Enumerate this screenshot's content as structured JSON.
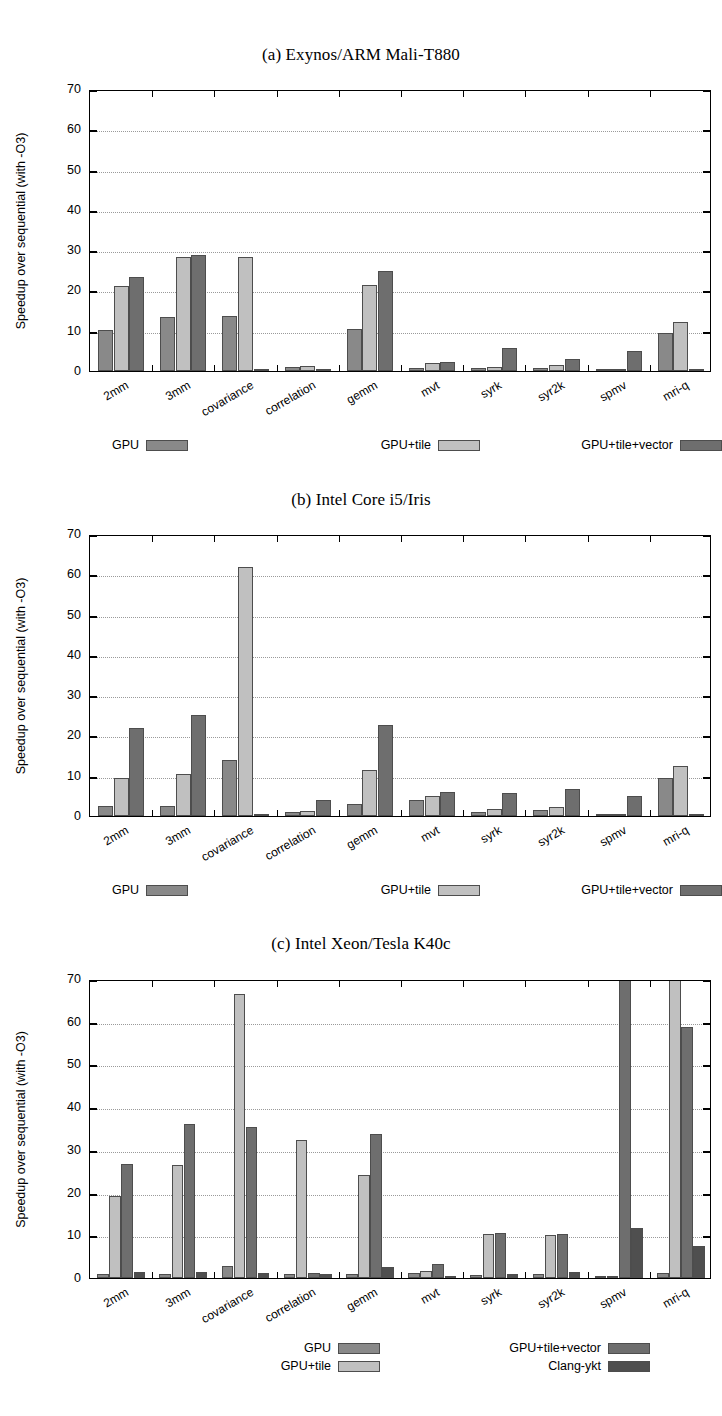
{
  "figure": {
    "ylabel": "Speedup over sequential (with -O3)",
    "yticks": [
      0,
      10,
      20,
      30,
      40,
      50,
      60,
      70
    ],
    "colors": {
      "gpu": "#898989",
      "gpu_tile": "#c0c0c0",
      "gpu_tile_vector": "#6e6e6e",
      "clang_ykt": "#4f4f4f",
      "grid": "#9a9a9a",
      "axis": "#000000"
    }
  },
  "charts": [
    {
      "id": "a",
      "title": "(a) Exynos/ARM Mali-T880",
      "chart_data": {
        "type": "bar",
        "title": "(a) Exynos/ARM Mali-T880",
        "xlabel": "",
        "ylabel": "Speedup over sequential (with -O3)",
        "ylim": [
          0,
          70
        ],
        "yticks": [
          0,
          10,
          20,
          30,
          40,
          50,
          60,
          70
        ],
        "grid": true,
        "legend_position": "below",
        "categories": [
          "2mm",
          "3mm",
          "covariance",
          "correlation",
          "gemm",
          "mvt",
          "syrk",
          "syr2k",
          "spmv",
          "mri-q"
        ],
        "series": [
          {
            "name": "GPU",
            "values": [
              10.2,
              13.3,
              13.7,
              1.0,
              10.5,
              0.7,
              0.8,
              0.7,
              0.3,
              9.4
            ]
          },
          {
            "name": "GPU+tile",
            "values": [
              21.2,
              28.2,
              28.4,
              1.2,
              21.3,
              1.9,
              1.0,
              1.6,
              0.3,
              12.2
            ]
          },
          {
            "name": "GPU+tile+vector",
            "values": [
              23.3,
              28.9,
              0.2,
              0.2,
              24.8,
              2.2,
              5.8,
              2.9,
              4.9,
              0.2
            ]
          }
        ]
      }
    },
    {
      "id": "b",
      "title": "(b) Intel Core i5/Iris",
      "chart_data": {
        "type": "bar",
        "title": "(b) Intel Core i5/Iris",
        "xlabel": "",
        "ylabel": "Speedup over sequential (with -O3)",
        "ylim": [
          0,
          70
        ],
        "yticks": [
          0,
          10,
          20,
          30,
          40,
          50,
          60,
          70
        ],
        "grid": true,
        "legend_position": "below",
        "categories": [
          "2mm",
          "3mm",
          "covariance",
          "correlation",
          "gemm",
          "mvt",
          "syrk",
          "syr2k",
          "spmv",
          "mri-q"
        ],
        "series": [
          {
            "name": "GPU",
            "values": [
              2.4,
              2.6,
              13.8,
              1.1,
              2.9,
              3.9,
              1.1,
              1.5,
              0.3,
              9.5
            ]
          },
          {
            "name": "GPU+tile",
            "values": [
              9.4,
              10.4,
              61.7,
              1.2,
              11.4,
              4.9,
              1.7,
              2.2,
              0.3,
              12.3
            ]
          },
          {
            "name": "GPU+tile+vector",
            "values": [
              21.9,
              25.1,
              0.2,
              3.9,
              22.5,
              5.9,
              5.8,
              6.6,
              5.0,
              0.2
            ]
          }
        ]
      }
    },
    {
      "id": "c",
      "title": "(c) Intel Xeon/Tesla K40c",
      "chart_data": {
        "type": "bar",
        "title": "(c) Intel Xeon/Tesla K40c",
        "xlabel": "",
        "ylabel": "Speedup over sequential (with -O3)",
        "ylim": [
          0,
          70
        ],
        "yticks": [
          0,
          10,
          20,
          30,
          40,
          50,
          60,
          70
        ],
        "grid": true,
        "legend_position": "below",
        "note": "bars exceeding 70 are clipped at the top axis",
        "categories": [
          "2mm",
          "3mm",
          "covariance",
          "correlation",
          "gemm",
          "mvt",
          "syrk",
          "syr2k",
          "spmv",
          "mri-q"
        ],
        "series": [
          {
            "name": "GPU",
            "values": [
              0.9,
              1.0,
              2.9,
              0.9,
              1.0,
              1.1,
              0.8,
              0.9,
              0.4,
              1.1
            ]
          },
          {
            "name": "GPU+tile",
            "values": [
              19.3,
              26.4,
              66.6,
              32.3,
              24.1,
              1.6,
              10.4,
              10.0,
              0.5,
              73.0
            ]
          },
          {
            "name": "GPU+tile+vector",
            "values": [
              26.8,
              36.0,
              35.3,
              1.1,
              33.8,
              3.3,
              10.6,
              10.4,
              73.0,
              58.8
            ]
          },
          {
            "name": "Clang-ykt",
            "values": [
              1.3,
              1.5,
              1.1,
              1.0,
              2.6,
              0.2,
              0.9,
              1.3,
              11.7,
              7.6
            ]
          }
        ]
      }
    }
  ]
}
